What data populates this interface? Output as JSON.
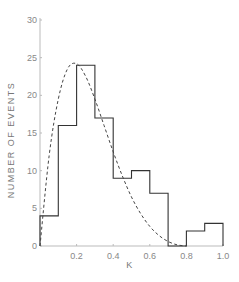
{
  "chart_data": {
    "type": "bar",
    "title": "",
    "xlabel": "K",
    "ylabel": "NUMBER OF EVENTS",
    "xlim": [
      0,
      1.0
    ],
    "ylim": [
      0,
      30
    ],
    "xticks": [
      0.2,
      0.4,
      0.6,
      0.8,
      1.0
    ],
    "xtick_labels": [
      "0.2",
      "0.4",
      "0.6",
      "0.8",
      "1.0"
    ],
    "yticks": [
      0,
      5,
      10,
      15,
      20,
      25,
      30
    ],
    "ytick_labels": [
      "0",
      "5",
      "10",
      "15",
      "20",
      "25",
      "30"
    ],
    "grid": false,
    "categories": [
      "0.0-0.1",
      "0.1-0.2",
      "0.2-0.3",
      "0.3-0.4",
      "0.4-0.5",
      "0.5-0.6",
      "0.6-0.7",
      "0.7-0.8",
      "0.8-0.9",
      "0.9-1.0"
    ],
    "bin_edges": [
      0.0,
      0.1,
      0.2,
      0.3,
      0.4,
      0.5,
      0.6,
      0.7,
      0.8,
      0.9,
      1.0
    ],
    "values": [
      4,
      16,
      24,
      17,
      9,
      10,
      7,
      0,
      2,
      3
    ],
    "series": [
      {
        "name": "Histogram",
        "style": "solid step",
        "values": [
          4,
          16,
          24,
          17,
          9,
          10,
          7,
          0,
          2,
          3
        ]
      },
      {
        "name": "Fitted curve",
        "style": "dashed",
        "x": [
          0.0,
          0.05,
          0.1,
          0.15,
          0.2,
          0.25,
          0.3,
          0.35,
          0.4,
          0.45,
          0.5,
          0.55,
          0.6,
          0.65,
          0.7,
          0.75,
          0.8
        ],
        "values": [
          0,
          12,
          19.5,
          23.5,
          24.2,
          22.5,
          19.5,
          16,
          12.5,
          9.3,
          6.5,
          4.3,
          2.6,
          1.4,
          0.6,
          0.15,
          0
        ]
      }
    ]
  }
}
